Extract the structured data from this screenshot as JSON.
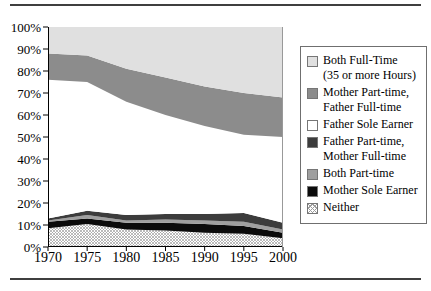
{
  "figure": {
    "top_rule_color": "#3f3f3f",
    "bottom_rule_color": "#3f3f3f",
    "background": "#ffffff"
  },
  "chart_data": {
    "type": "area",
    "stacked": true,
    "title": "",
    "xlabel": "",
    "ylabel": "",
    "x": [
      1970,
      1975,
      1980,
      1985,
      1990,
      1995,
      2000
    ],
    "x_tick_labels": [
      "1970",
      "1975",
      "1980",
      "1985",
      "1990",
      "1995",
      "2000"
    ],
    "y_tick_values": [
      0,
      10,
      20,
      30,
      40,
      50,
      60,
      70,
      80,
      90,
      100
    ],
    "y_tick_labels": [
      "0%",
      "10%",
      "20%",
      "30%",
      "40%",
      "50%",
      "60%",
      "70%",
      "80%",
      "90%",
      "100%"
    ],
    "ylim": [
      0,
      100
    ],
    "grid": false,
    "legend_position": "right",
    "series": [
      {
        "name": "Neither",
        "fill": "hatch",
        "values": [
          8.5,
          10.5,
          8,
          7.5,
          6.5,
          6,
          4
        ]
      },
      {
        "name": "Mother Sole Earner",
        "fill": "#0b0b0b",
        "values": [
          3,
          2.5,
          3,
          3.5,
          4,
          3.5,
          2.5
        ]
      },
      {
        "name": "Both Part-time",
        "fill": "#9f9f9f",
        "values": [
          0.5,
          1.5,
          1,
          1.5,
          1.5,
          2,
          1.5
        ]
      },
      {
        "name": "Father Part-time, Mother Full-time",
        "fill": "#3c3c3c",
        "values": [
          1,
          2,
          2.5,
          2.5,
          3,
          4,
          3
        ]
      },
      {
        "name": "Father Sole Earner",
        "fill": "#ffffff",
        "values": [
          63,
          58.5,
          51.5,
          45,
          40,
          35.5,
          39
        ]
      },
      {
        "name": "Mother Part-time, Father Full-time",
        "fill": "#8c8c8c",
        "values": [
          12,
          12,
          15,
          17,
          18,
          19,
          18
        ]
      },
      {
        "name": "Both Full-Time (35 or more Hours)",
        "fill": "#e0e0e0",
        "values": [
          12,
          13,
          19,
          23,
          27,
          30,
          32
        ]
      }
    ],
    "legend_items": [
      {
        "lines": [
          "Both Full-Time",
          "(35 or more Hours)"
        ],
        "fill": "#e0e0e0"
      },
      {
        "lines": [
          "Mother Part-time,",
          "Father Full-time"
        ],
        "fill": "#8c8c8c"
      },
      {
        "lines": [
          "Father Sole Earner"
        ],
        "fill": "#ffffff"
      },
      {
        "lines": [
          "Father Part-time,",
          "Mother Full-time"
        ],
        "fill": "#3c3c3c"
      },
      {
        "lines": [
          "Both Part-time"
        ],
        "fill": "#9f9f9f"
      },
      {
        "lines": [
          "Mother Sole Earner"
        ],
        "fill": "#0b0b0b"
      },
      {
        "lines": [
          "Neither"
        ],
        "fill": "hatch"
      }
    ],
    "axis_color": "#000000",
    "plot_right_edge_color": "#999999"
  }
}
